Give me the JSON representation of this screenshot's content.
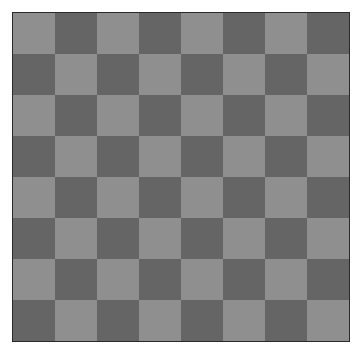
{
  "board": {
    "rows": 8,
    "cols": 8,
    "colors": {
      "light": "#8f8f8f",
      "dark": "#656565",
      "border": "#2a2a2a"
    },
    "top_left": "light",
    "pieces": []
  }
}
